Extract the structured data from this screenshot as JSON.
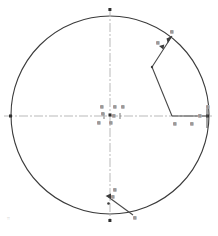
{
  "drawing": {
    "title": "circular-part-dimension-drawing",
    "colors": {
      "outline": "#3b3b3b",
      "centerline": "#b9b9b9",
      "leader": "#4a4a4a",
      "label_text": "#3a3a3a",
      "label_bg": "#d9d9d9",
      "background": "#ffffff",
      "corner_mark": "#c8c8c8"
    },
    "circle": {
      "center_x": 110,
      "center_y": 115,
      "radius": 99
    },
    "centerlines": {
      "horizontal_y": 116,
      "vertical_x": 110,
      "style": "dash-dot"
    },
    "corner_mark": {
      "label": "⌗"
    },
    "labels": [
      {
        "name": "label-top-right-outer",
        "text": "▨",
        "x": 170,
        "y": 30
      },
      {
        "name": "label-top-right-inner",
        "text": "▨",
        "x": 156,
        "y": 41
      },
      {
        "name": "label-center-upper-left",
        "text": "▨",
        "x": 100,
        "y": 105
      },
      {
        "name": "label-center-upper-mid",
        "text": "▨",
        "x": 113,
        "y": 105
      },
      {
        "name": "label-center-upper-right",
        "text": "▨",
        "x": 121,
        "y": 105
      },
      {
        "name": "label-center-left",
        "text": "▨",
        "x": 101,
        "y": 112
      },
      {
        "name": "label-center-mid",
        "text": "▨",
        "x": 112,
        "y": 114
      },
      {
        "name": "label-center-lower-left",
        "text": "▨",
        "x": 97,
        "y": 121
      },
      {
        "name": "label-center-lower-mid",
        "text": "▨",
        "x": 109,
        "y": 121
      },
      {
        "name": "label-right-edge",
        "text": "▨",
        "x": 206,
        "y": 105
      },
      {
        "name": "label-right-inner",
        "text": "▨",
        "x": 198,
        "y": 114
      },
      {
        "name": "label-right-lower-left",
        "text": "▨",
        "x": 173,
        "y": 122
      },
      {
        "name": "label-right-lower-mid",
        "text": "▨",
        "x": 190,
        "y": 122
      },
      {
        "name": "label-bottom-upper",
        "text": "▨",
        "x": 113,
        "y": 188
      },
      {
        "name": "label-bottom-mid",
        "text": "▨",
        "x": 111,
        "y": 195
      },
      {
        "name": "label-bottom-outer",
        "text": "▨",
        "x": 133,
        "y": 216
      }
    ]
  }
}
